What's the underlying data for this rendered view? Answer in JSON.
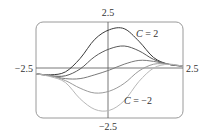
{
  "chart_data": {
    "type": "line",
    "title": "",
    "xlabel": "",
    "ylabel": "",
    "xlim": [
      -2.5,
      2.5
    ],
    "ylim": [
      -2.5,
      2.5
    ],
    "grid": false,
    "legend": "none",
    "frame": "rounded-rectangle",
    "tick_labels": {
      "x_left": "−2.5",
      "x_right": "2.5",
      "y_top": "2.5",
      "y_bottom": "−2.5"
    },
    "annotations": [
      {
        "text_var": "C",
        "text_rest": " = 2",
        "x": 1.15,
        "y": 1.75
      },
      {
        "text_var": "C",
        "text_rest": " = −2",
        "x": 0.8,
        "y": -1.6
      }
    ],
    "x": [
      -2.5,
      -2.0,
      -1.5,
      -1.0,
      -0.5,
      0.0,
      0.5,
      1.0,
      1.5,
      2.0,
      2.5
    ],
    "series": [
      {
        "name": "C = 2",
        "color": "#3a3a3a",
        "values": [
          -0.2,
          -0.25,
          -0.1,
          0.6,
          1.6,
          2.1,
          2.15,
          1.5,
          0.65,
          0.3,
          0.2
        ]
      },
      {
        "name": "C = 1",
        "color": "#5a5a5a",
        "values": [
          -0.2,
          -0.3,
          -0.3,
          0.05,
          0.7,
          1.1,
          1.25,
          1.0,
          0.55,
          0.3,
          0.2
        ]
      },
      {
        "name": "C = 0",
        "color": "#7a7a7a",
        "values": [
          -0.2,
          -0.3,
          -0.45,
          -0.45,
          -0.25,
          0.0,
          0.3,
          0.5,
          0.45,
          0.3,
          0.2
        ]
      },
      {
        "name": "C = -1",
        "color": "#9a9a9a",
        "values": [
          -0.2,
          -0.3,
          -0.55,
          -0.95,
          -1.2,
          -1.1,
          -0.7,
          -0.05,
          0.3,
          0.3,
          0.2
        ]
      },
      {
        "name": "C = -2",
        "color": "#b8b8b8",
        "values": [
          -0.2,
          -0.35,
          -0.65,
          -1.5,
          -2.05,
          -2.1,
          -1.6,
          -0.6,
          0.1,
          0.3,
          0.2
        ]
      }
    ]
  }
}
